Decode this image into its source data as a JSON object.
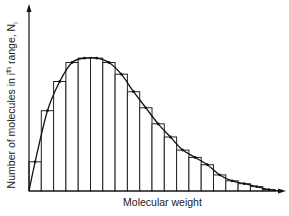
{
  "chart_data": {
    "type": "bar",
    "title": "",
    "xlabel": "Molecular weight",
    "ylabel": "Number of molecules in ith range, Ni",
    "ylabel_parts": {
      "main": "Number of molecules in i",
      "sup": "th",
      "after": " range, N",
      "sub": "i"
    },
    "grid": false,
    "legend": null,
    "categories": [
      "1",
      "2",
      "3",
      "4",
      "5",
      "6",
      "7",
      "8",
      "9",
      "10",
      "11",
      "12",
      "13",
      "14",
      "15",
      "16",
      "17",
      "18",
      "19",
      "20"
    ],
    "values": [
      20,
      55,
      75,
      88,
      91,
      91,
      88,
      80,
      68,
      57,
      46,
      37,
      28,
      23,
      18,
      11,
      7,
      5,
      3,
      1
    ],
    "ylim": [
      0,
      100
    ],
    "overlay": {
      "type": "line",
      "name": "smooth distribution curve",
      "smooth": true
    }
  }
}
